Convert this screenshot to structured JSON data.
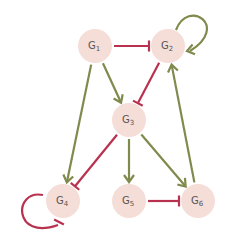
{
  "colors": {
    "node_fill": "#f5ddd8",
    "activation": "#7f8a4c",
    "inhibition": "#b8324f",
    "label": "#555555"
  },
  "nodes": [
    {
      "id": "G1",
      "letter": "G",
      "sub": "1"
    },
    {
      "id": "G2",
      "letter": "G",
      "sub": "2"
    },
    {
      "id": "G3",
      "letter": "G",
      "sub": "3"
    },
    {
      "id": "G4",
      "letter": "G",
      "sub": "4"
    },
    {
      "id": "G5",
      "letter": "G",
      "sub": "5"
    },
    {
      "id": "G6",
      "letter": "G",
      "sub": "6"
    }
  ],
  "edges": [
    {
      "from": "G1",
      "to": "G2",
      "type": "inhibition"
    },
    {
      "from": "G2",
      "to": "G2",
      "type": "activation"
    },
    {
      "from": "G2",
      "to": "G3",
      "type": "inhibition"
    },
    {
      "from": "G1",
      "to": "G3",
      "type": "activation"
    },
    {
      "from": "G1",
      "to": "G4",
      "type": "activation"
    },
    {
      "from": "G3",
      "to": "G4",
      "type": "inhibition"
    },
    {
      "from": "G3",
      "to": "G5",
      "type": "activation"
    },
    {
      "from": "G3",
      "to": "G6",
      "type": "activation"
    },
    {
      "from": "G5",
      "to": "G6",
      "type": "inhibition"
    },
    {
      "from": "G6",
      "to": "G2",
      "type": "activation"
    },
    {
      "from": "G4",
      "to": "G4",
      "type": "inhibition"
    }
  ]
}
